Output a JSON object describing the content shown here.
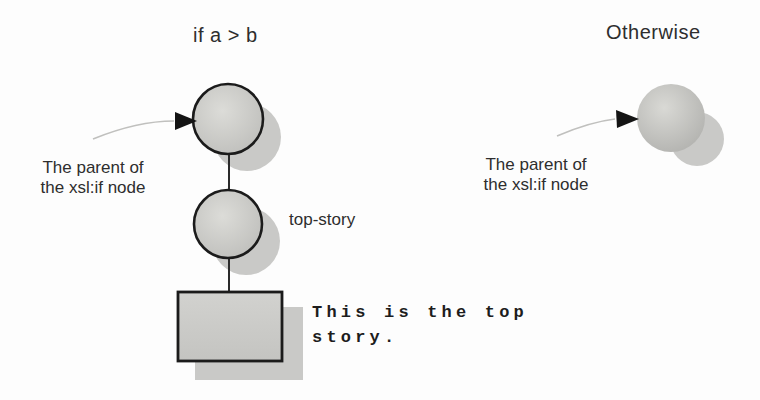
{
  "figure": {
    "left": {
      "title": "if a > b",
      "parent_label": {
        "line1": "The parent of",
        "line2": "the xsl:if node"
      },
      "node_label": "top-story",
      "text_node": {
        "line1": "This is the top",
        "line2": "story."
      }
    },
    "right": {
      "title": "Otherwise",
      "parent_label": {
        "line1": "The parent of",
        "line2": "the xsl:if node"
      }
    },
    "colors": {
      "background": "#fdfdfd",
      "node_fill_center": "#dcdcd8",
      "node_fill_edge": "#bcbcb9",
      "sphere_fill_center": "#d9d9d5",
      "sphere_fill_edge": "#aeaeab",
      "rect_fill_top": "#d2d2cf",
      "rect_fill_bottom": "#c4c4c1",
      "shadow": "#c9c9c7",
      "node_outline": "#1b1b1b",
      "connector": "#2a2a2a",
      "arrow_line": "#c0c0be",
      "arrowhead": "#141414",
      "text": "#2e2e2e"
    }
  }
}
